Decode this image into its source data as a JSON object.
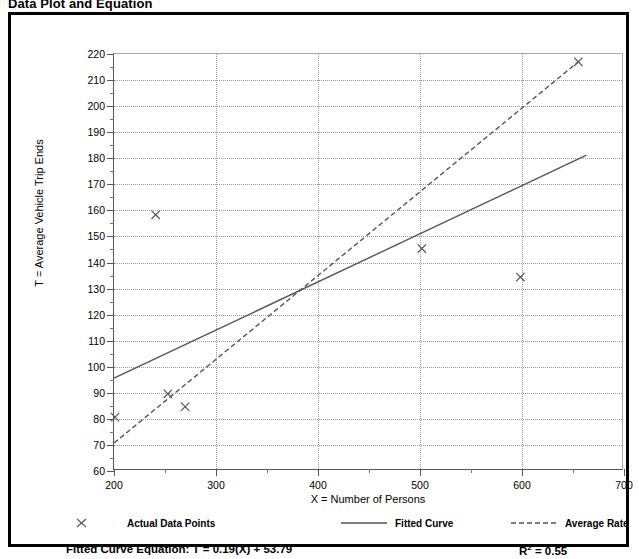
{
  "title": "Data Plot and Equation",
  "axis": {
    "x_label": "X = Number of Persons",
    "y_label": "T = Average Vehicle Trip Ends"
  },
  "legend": {
    "items": [
      {
        "label": "Actual Data Points",
        "marker": "x-marker-icon",
        "style": "marker"
      },
      {
        "label": "Fitted Curve",
        "marker": "solid-line-icon",
        "style": "solid"
      },
      {
        "label": "Average Rate",
        "marker": "dashed-line-icon",
        "style": "dashed"
      }
    ]
  },
  "footer": {
    "equation_label": "Fitted Curve Equation:",
    "equation": "T = 0.19(X) + 53.79",
    "r2_prefix": "R",
    "r2_exponent": "2",
    "r2_value": " = 0.55"
  },
  "chart_data": {
    "type": "scatter",
    "title": "Data Plot and Equation",
    "xlabel": "X = Number of Persons",
    "ylabel": "T = Average Vehicle Trip Ends",
    "xlim": [
      200,
      700
    ],
    "ylim": [
      60,
      220
    ],
    "xticks": [
      200,
      300,
      400,
      500,
      600,
      700
    ],
    "xticks_minor": [
      250,
      350,
      450,
      550,
      650
    ],
    "yticks": [
      60,
      70,
      80,
      90,
      100,
      110,
      120,
      130,
      140,
      150,
      160,
      170,
      180,
      190,
      200,
      210,
      220
    ],
    "grid": true,
    "legend_position": "bottom",
    "series": [
      {
        "name": "Actual Data Points",
        "type": "scatter",
        "marker": "x",
        "color": "#555555",
        "points": [
          {
            "x": 201,
            "y": 80
          },
          {
            "x": 241,
            "y": 158
          },
          {
            "x": 253,
            "y": 89
          },
          {
            "x": 270,
            "y": 84
          },
          {
            "x": 503,
            "y": 145
          },
          {
            "x": 600,
            "y": 134
          },
          {
            "x": 657,
            "y": 217
          }
        ]
      },
      {
        "name": "Fitted Curve",
        "type": "line",
        "style": "solid",
        "color": "#555555",
        "equation": "T = 0.19(X) + 53.79",
        "r_squared": 0.55,
        "points": [
          {
            "x": 200,
            "y": 95
          },
          {
            "x": 665,
            "y": 181
          }
        ]
      },
      {
        "name": "Average Rate",
        "type": "line",
        "style": "dashed",
        "color": "#555555",
        "points": [
          {
            "x": 200,
            "y": 70
          },
          {
            "x": 657,
            "y": 217
          }
        ]
      }
    ]
  }
}
